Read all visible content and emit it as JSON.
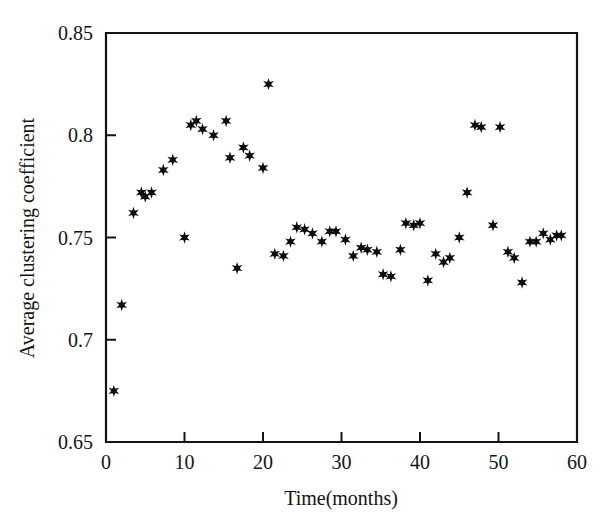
{
  "figure": {
    "background_color": "#ffffff",
    "marker_color": "#0d0d0d",
    "axis_color": "#141414",
    "marker_symbol": "asterisk-marker"
  },
  "chart_data": {
    "type": "scatter",
    "title": "",
    "subtitle": "",
    "xlabel": "Time(months)",
    "ylabel": "Average clustering coefficient",
    "xlim": [
      0,
      60
    ],
    "ylim": [
      0.65,
      0.85
    ],
    "xticks": [
      0,
      10,
      20,
      30,
      40,
      50,
      60
    ],
    "xtick_labels": [
      "0",
      "10",
      "20",
      "30",
      "40",
      "50",
      "60"
    ],
    "yticks": [
      0.65,
      0.7,
      0.75,
      0.8,
      0.85
    ],
    "ytick_labels": [
      "0.65",
      "0.7",
      "0.75",
      "0.8",
      "0.85"
    ],
    "grid": false,
    "legend": null,
    "annotations": [],
    "series": [
      {
        "name": "Average clustering coefficient",
        "marker": "asterisk",
        "color": "#0d0d0d",
        "x": [
          1,
          2,
          3.5,
          4.5,
          5,
          5.8,
          7.3,
          8.5,
          10,
          10.8,
          11.5,
          12.3,
          13.7,
          15.3,
          15.8,
          16.7,
          17.5,
          18.3,
          20,
          20.7,
          21.5,
          22.6,
          23.5,
          24.3,
          25.3,
          26.3,
          27.5,
          28.5,
          29.3,
          30.5,
          31.5,
          32.5,
          33.3,
          34.5,
          35.3,
          36.3,
          37.5,
          38.2,
          39.2,
          40,
          41,
          42,
          43,
          43.8,
          45,
          46,
          47,
          47.8,
          49.3,
          50.2,
          51.2,
          52,
          53,
          54,
          54.8,
          55.7,
          56.6,
          57.4,
          58
        ],
        "y": [
          0.675,
          0.717,
          0.762,
          0.772,
          0.77,
          0.772,
          0.783,
          0.788,
          0.75,
          0.805,
          0.807,
          0.803,
          0.8,
          0.807,
          0.789,
          0.735,
          0.794,
          0.79,
          0.784,
          0.825,
          0.742,
          0.741,
          0.748,
          0.755,
          0.754,
          0.752,
          0.748,
          0.753,
          0.753,
          0.749,
          0.741,
          0.745,
          0.744,
          0.743,
          0.732,
          0.731,
          0.744,
          0.757,
          0.756,
          0.757,
          0.729,
          0.742,
          0.738,
          0.74,
          0.75,
          0.772,
          0.805,
          0.804,
          0.756,
          0.804,
          0.743,
          0.74,
          0.728,
          0.748,
          0.748,
          0.752,
          0.749,
          0.751,
          0.751
        ]
      }
    ]
  }
}
